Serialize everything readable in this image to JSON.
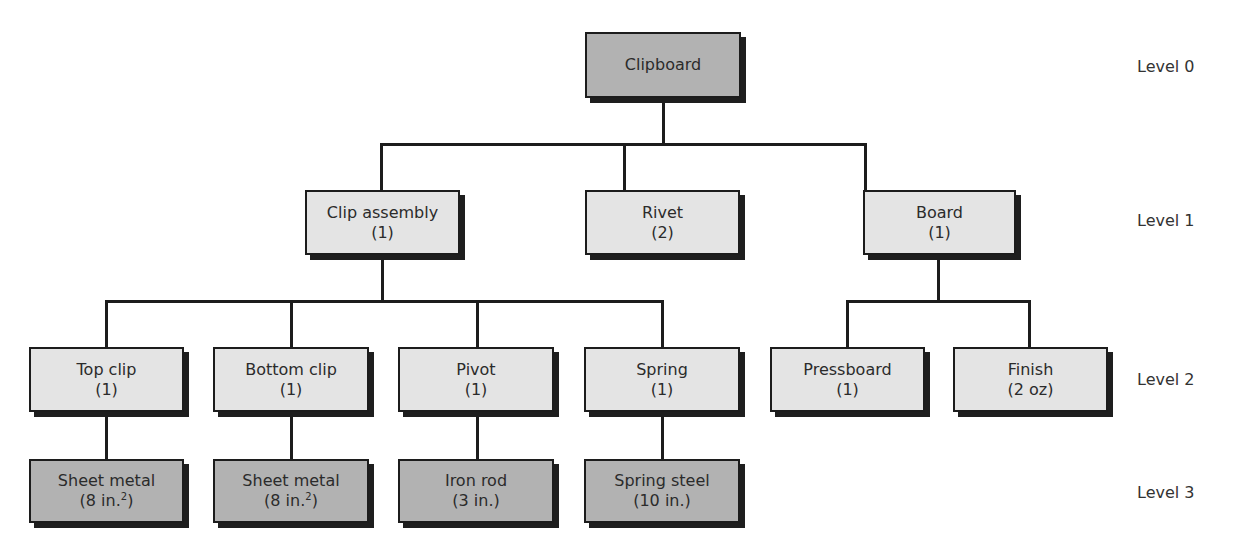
{
  "diagram": {
    "type": "bill-of-materials-tree",
    "levels": [
      "Level 0",
      "Level 1",
      "Level 2",
      "Level 3"
    ],
    "nodes": {
      "clipboard": {
        "name": "Clipboard",
        "qty": ""
      },
      "clip_assembly": {
        "name": "Clip assembly",
        "qty": "(1)"
      },
      "rivet": {
        "name": "Rivet",
        "qty": "(2)"
      },
      "board": {
        "name": "Board",
        "qty": "(1)"
      },
      "top_clip": {
        "name": "Top clip",
        "qty": "(1)"
      },
      "bottom_clip": {
        "name": "Bottom clip",
        "qty": "(1)"
      },
      "pivot": {
        "name": "Pivot",
        "qty": "(1)"
      },
      "spring": {
        "name": "Spring",
        "qty": "(1)"
      },
      "pressboard": {
        "name": "Pressboard",
        "qty": "(1)"
      },
      "finish": {
        "name": "Finish",
        "qty": "(2 oz)"
      },
      "sheet_metal_1": {
        "name": "Sheet metal",
        "qty_pre": "(8 in.",
        "qty_sup": "2",
        "qty_post": ")"
      },
      "sheet_metal_2": {
        "name": "Sheet metal",
        "qty_pre": "(8 in.",
        "qty_sup": "2",
        "qty_post": ")"
      },
      "iron_rod": {
        "name": "Iron rod",
        "qty": "(3 in.)"
      },
      "spring_steel": {
        "name": "Spring steel",
        "qty": "(10 in.)"
      }
    },
    "edges": [
      [
        "clipboard",
        "clip_assembly"
      ],
      [
        "clipboard",
        "rivet"
      ],
      [
        "clipboard",
        "board"
      ],
      [
        "clip_assembly",
        "top_clip"
      ],
      [
        "clip_assembly",
        "bottom_clip"
      ],
      [
        "clip_assembly",
        "pivot"
      ],
      [
        "clip_assembly",
        "spring"
      ],
      [
        "board",
        "pressboard"
      ],
      [
        "board",
        "finish"
      ],
      [
        "top_clip",
        "sheet_metal_1"
      ],
      [
        "bottom_clip",
        "sheet_metal_2"
      ],
      [
        "pivot",
        "iron_rod"
      ],
      [
        "spring",
        "spring_steel"
      ]
    ],
    "colors": {
      "end_item_and_raw_material_fill": "#b2b2b2",
      "component_fill": "#e4e4e4",
      "line": "#1c1c1c"
    }
  }
}
